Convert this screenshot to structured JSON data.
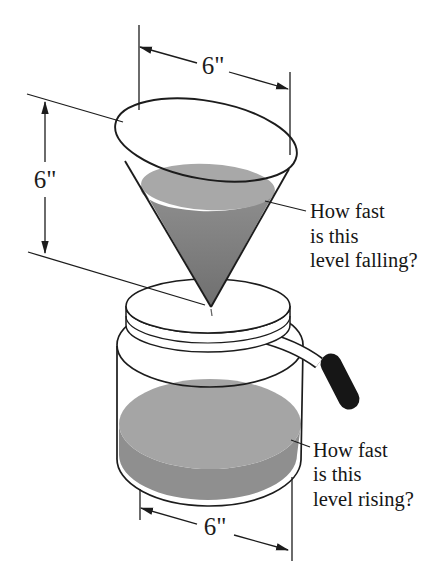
{
  "figure": {
    "kind": "textbook-related-rates-diagram",
    "cone": {
      "diameter_label": "6\"",
      "height_label": "6\"",
      "annotation_line1": "How fast",
      "annotation_line2": "is this",
      "annotation_line3": "level falling?"
    },
    "pot": {
      "diameter_label": "6\"",
      "annotation_line1": "How fast",
      "annotation_line2": "is this",
      "annotation_line3": "level rising?"
    },
    "colors": {
      "outline": "#1c1c1c",
      "cone_liquid_surface": "#a8a8a8",
      "cone_liquid_body_top": "#949494",
      "cone_liquid_body_bottom": "#6f6f6f",
      "pot_liquid_surface": "#a5a5a5",
      "pot_liquid_side": "#8f8f8f",
      "handle_grip": "#161616",
      "lid_fill": "#ffffff",
      "background": "#ffffff"
    }
  }
}
